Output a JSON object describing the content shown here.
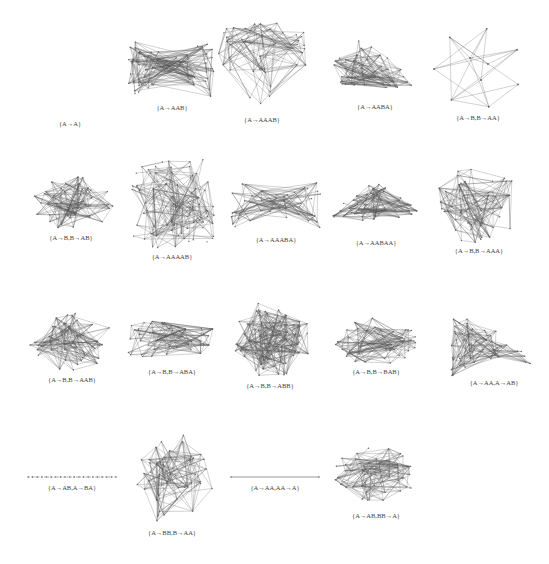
{
  "figure": {
    "background": "#ffffff",
    "edge_color": "#555555",
    "rows": [
      {
        "graphs": [
          {
            "label": "{A→A}",
            "type": "empty",
            "cx": 70,
            "cy": 70,
            "w": 0,
            "h": 0,
            "label_y": 124
          },
          {
            "label": "{A→AAB}",
            "type": "x-fractal",
            "cx": 172,
            "cy": 68,
            "w": 88,
            "h": 60,
            "label_y": 108
          },
          {
            "label": "{A→AAAB}",
            "type": "y-fractal",
            "cx": 262,
            "cy": 68,
            "w": 90,
            "h": 90,
            "label_y": 120
          },
          {
            "label": "{A→AABA}",
            "type": "triangle",
            "cx": 375,
            "cy": 63,
            "w": 88,
            "h": 50,
            "label_y": 107
          },
          {
            "label": "{A→B,B→AA}",
            "type": "heptagon",
            "cx": 478,
            "cy": 68,
            "w": 88,
            "h": 80,
            "label_y": 118
          }
        ]
      },
      {
        "graphs": [
          {
            "label": "{A→B,B→AB}",
            "type": "oval",
            "cx": 71,
            "cy": 203,
            "w": 88,
            "h": 54,
            "label_y": 238
          },
          {
            "label": "{A→AAAAB}",
            "type": "cross-fractal",
            "cx": 172,
            "cy": 204,
            "w": 88,
            "h": 90,
            "label_y": 257
          },
          {
            "label": "{A→AAABA}",
            "type": "bowtie",
            "cx": 276,
            "cy": 205,
            "w": 90,
            "h": 50,
            "label_y": 240
          },
          {
            "label": "{A→AABAA}",
            "type": "arch",
            "cx": 376,
            "cy": 207,
            "w": 90,
            "h": 60,
            "label_y": 243
          },
          {
            "label": "{A→B,B→AAA}",
            "type": "blob",
            "cx": 479,
            "cy": 204,
            "w": 88,
            "h": 80,
            "label_y": 251
          }
        ]
      },
      {
        "graphs": [
          {
            "label": "{A→B,B→AAB}",
            "type": "oval",
            "cx": 72,
            "cy": 343,
            "w": 88,
            "h": 62,
            "label_y": 380
          },
          {
            "label": "{A→B,B→ABA}",
            "type": "cone",
            "cx": 172,
            "cy": 340,
            "w": 88,
            "h": 44,
            "label_y": 372
          },
          {
            "label": "{A→B,B→ABB}",
            "type": "star-blob",
            "cx": 270,
            "cy": 340,
            "w": 88,
            "h": 80,
            "label_y": 386
          },
          {
            "label": "{A→B,B→BAB}",
            "type": "hexagon",
            "cx": 376,
            "cy": 340,
            "w": 88,
            "h": 48,
            "label_y": 372
          },
          {
            "label": "{A→AA,A→AB}",
            "type": "comet",
            "cx": 494,
            "cy": 344,
            "w": 88,
            "h": 66,
            "label_y": 383
          }
        ]
      },
      {
        "graphs": [
          {
            "label": "{A→AB,A→BA}",
            "type": "path",
            "cx": 72,
            "cy": 477,
            "w": 88,
            "h": 0,
            "label_y": 488
          },
          {
            "label": "{A→BB,B→AA}",
            "type": "star",
            "cx": 172,
            "cy": 476,
            "w": 88,
            "h": 96,
            "label_y": 533
          },
          {
            "label": "{A→AA,AA→A}",
            "type": "line",
            "cx": 275,
            "cy": 477,
            "w": 88,
            "h": 0,
            "label_y": 488
          },
          {
            "label": "{A→AB,BB→A}",
            "type": "blob",
            "cx": 376,
            "cy": 475,
            "w": 88,
            "h": 56,
            "label_y": 516
          }
        ]
      }
    ]
  }
}
